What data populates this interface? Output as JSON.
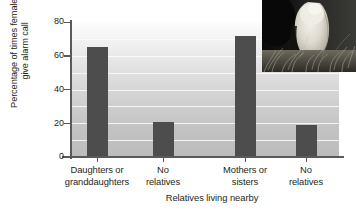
{
  "chart_data": {
    "type": "bar",
    "title": "",
    "subtitle": "",
    "xlabel": "Relatives living nearby",
    "ylabel": "Percentage of times females give alarm call",
    "ylabel_line1": "Percentage of times females",
    "ylabel_line2": "give alarm call",
    "categories": [
      "Daughters or granddaughters",
      "No relatives",
      "Mothers or sisters",
      "No relatives"
    ],
    "category_lines": [
      [
        "Daughters or",
        "granddaughters"
      ],
      [
        "No",
        "relatives"
      ],
      [
        "Mothers or",
        "sisters"
      ],
      [
        "No",
        "relatives"
      ]
    ],
    "values": [
      65,
      21,
      72,
      19
    ],
    "ylim": [
      0,
      80
    ],
    "yticks": [
      0,
      20,
      40,
      60,
      80
    ],
    "ytick_labels": [
      "0",
      "20",
      "40",
      "60",
      "80"
    ],
    "grid": true,
    "gridline_step": 10,
    "legend": "none",
    "bar_color": "#4d4d4d",
    "axis_color": "#58595b",
    "text_color": "#231f20",
    "plot_bg_top": "#fdfdfd",
    "plot_bg_bottom": "#bcbcbc"
  },
  "inset": {
    "name": "ground-squirrel-photo",
    "description": "Grayscale photograph of a ground squirrel standing upright in grass"
  }
}
